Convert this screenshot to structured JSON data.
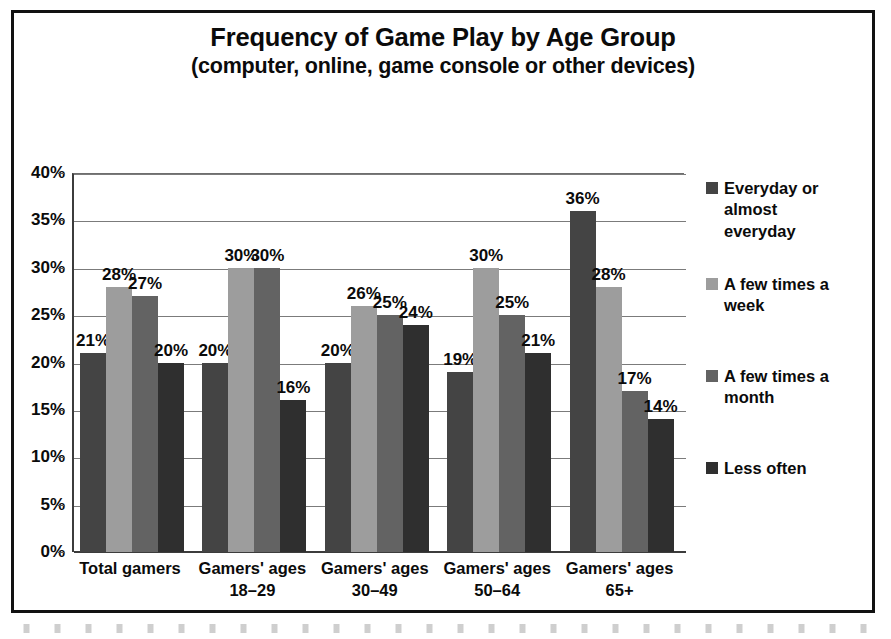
{
  "chart_data": {
    "type": "bar",
    "title": "Frequency of Game Play by Age Group",
    "subtitle": "(computer, online, game console or other devices)",
    "xlabel": "",
    "ylabel": "",
    "ylim": [
      0,
      40
    ],
    "ytick_step": 5,
    "grid": true,
    "legend_position": "right",
    "value_label_suffix": "%",
    "categories": [
      "Total gamers",
      "Gamers' ages 18–29",
      "Gamers' ages 30–49",
      "Gamers' ages 50–64",
      "Gamers' ages 65+"
    ],
    "category_lines": [
      {
        "l1": "Total gamers",
        "l2": ""
      },
      {
        "l1": "Gamers' ages",
        "l2": "18–29"
      },
      {
        "l1": "Gamers' ages",
        "l2": "30–49"
      },
      {
        "l1": "Gamers' ages",
        "l2": "50–64"
      },
      {
        "l1": "Gamers' ages",
        "l2": "65+"
      }
    ],
    "ytick_labels": [
      "0%",
      "5%",
      "10%",
      "15%",
      "20%",
      "25%",
      "30%",
      "35%",
      "40%"
    ],
    "ytick_values": [
      0,
      5,
      10,
      15,
      20,
      25,
      30,
      35,
      40
    ],
    "series": [
      {
        "name": "Everyday or almost everyday",
        "legend_label": "Everyday or almost\neveryday",
        "color": "#444444",
        "values": [
          21,
          20,
          20,
          19,
          36
        ],
        "labels": [
          "21%",
          "20%",
          "20%",
          "19%",
          "36%"
        ]
      },
      {
        "name": "A few times a week",
        "legend_label": "A few times a week",
        "color": "#9d9d9d",
        "values": [
          28,
          30,
          26,
          30,
          28
        ],
        "labels": [
          "28%",
          "30%",
          "26%",
          "30%",
          "28%"
        ]
      },
      {
        "name": "A few times a month",
        "legend_label": "A few times a month",
        "color": "#636363",
        "values": [
          27,
          30,
          25,
          25,
          17
        ],
        "labels": [
          "27%",
          "30%",
          "25%",
          "25%",
          "17%"
        ]
      },
      {
        "name": "Less often",
        "legend_label": "Less often",
        "color": "#2f2f2f",
        "values": [
          20,
          16,
          24,
          21,
          14
        ],
        "labels": [
          "20%",
          "16%",
          "24%",
          "21%",
          "14%"
        ]
      }
    ]
  }
}
